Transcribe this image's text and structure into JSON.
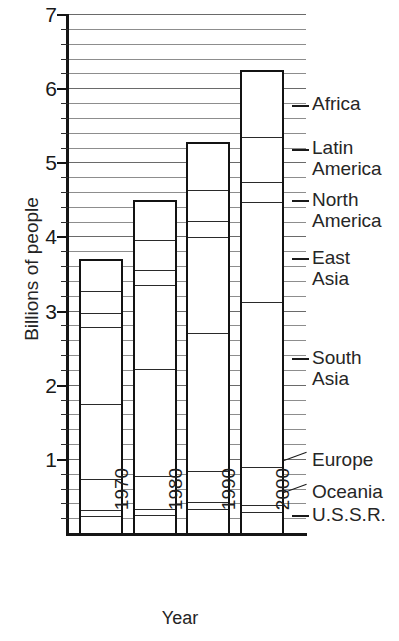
{
  "chart_data": {
    "type": "bar",
    "stacked": true,
    "title": "",
    "subtitle": "",
    "xlabel": "Year",
    "ylabel": "Billions of people",
    "categories": [
      "1970",
      "1980",
      "1990",
      "2000"
    ],
    "ylim": [
      0,
      7
    ],
    "ytick_labels": [
      "1",
      "2",
      "3",
      "4",
      "5",
      "6",
      "7"
    ],
    "ytick_values": [
      1,
      2,
      3,
      4,
      5,
      6,
      7
    ],
    "y_major_step": 1,
    "y_minor_step": 0.2,
    "grid": "horizontal",
    "legend_position": "right-outside",
    "units": "billions of people",
    "series": [
      {
        "name": "U.S.S.R.",
        "values": [
          0.26,
          0.27,
          0.35,
          0.31
        ]
      },
      {
        "name": "Oceania",
        "values": [
          0.08,
          0.08,
          0.1,
          0.1
        ]
      },
      {
        "name": "Europe",
        "values": [
          0.41,
          0.44,
          0.41,
          0.5
        ]
      },
      {
        "name": "South Asia",
        "values": [
          1.01,
          1.45,
          1.87,
          2.23
        ]
      },
      {
        "name": "East Asia",
        "values": [
          1.05,
          1.13,
          1.29,
          1.35
        ]
      },
      {
        "name": "North America",
        "values": [
          0.18,
          0.21,
          0.21,
          0.27
        ]
      },
      {
        "name": "Latin America",
        "values": [
          0.3,
          0.4,
          0.42,
          0.61
        ]
      },
      {
        "name": "Africa",
        "values": [
          0.41,
          0.51,
          0.63,
          0.88
        ]
      }
    ],
    "totals": [
      3.7,
      4.49,
      5.28,
      6.25
    ],
    "cumulative_tops": {
      "1970": [
        0.26,
        0.34,
        0.75,
        1.76,
        2.81,
        2.99,
        3.29,
        3.7
      ],
      "1980": [
        0.27,
        0.35,
        0.79,
        2.24,
        3.37,
        3.58,
        3.98,
        4.49
      ],
      "1990": [
        0.35,
        0.45,
        0.86,
        2.73,
        4.02,
        4.23,
        4.65,
        5.28
      ],
      "2000": [
        0.31,
        0.41,
        0.91,
        3.14,
        4.49,
        4.76,
        5.37,
        6.25
      ]
    },
    "colors": {
      "axis": "#151515",
      "grid": "#8d8d8d",
      "bar_outline": "#131313",
      "segment_divider": "#2a2a2a",
      "text": "#1c1c1c",
      "background": "#ffffff"
    }
  },
  "axis": {
    "y_title": "Billions of people",
    "x_title": "Year",
    "y_ticks": [
      "7",
      "6",
      "5",
      "4",
      "3",
      "2",
      "1"
    ],
    "x_ticks": [
      "1970",
      "1980",
      "1990",
      "2000"
    ]
  },
  "legend": {
    "items": [
      {
        "label": "Africa",
        "lines": [
          "Africa"
        ]
      },
      {
        "label": "Latin America",
        "lines": [
          "Latin",
          "America"
        ]
      },
      {
        "label": "North America",
        "lines": [
          "North",
          "America"
        ]
      },
      {
        "label": "East Asia",
        "lines": [
          "East",
          "Asia"
        ]
      },
      {
        "label": "South Asia",
        "lines": [
          "South",
          "Asia"
        ]
      },
      {
        "label": "Europe",
        "lines": [
          "Europe"
        ]
      },
      {
        "label": "Oceania",
        "lines": [
          "Oceania"
        ]
      },
      {
        "label": "U.S.S.R.",
        "lines": [
          "U.S.S.R."
        ]
      }
    ],
    "africa": "Africa",
    "latin_1": "Latin",
    "latin_2": "America",
    "north_1": "North",
    "north_2": "America",
    "east_1": "East",
    "east_2": "Asia",
    "south_1": "South",
    "south_2": "Asia",
    "europe": "Europe",
    "oceania": "Oceania",
    "ussr": "U.S.S.R."
  }
}
